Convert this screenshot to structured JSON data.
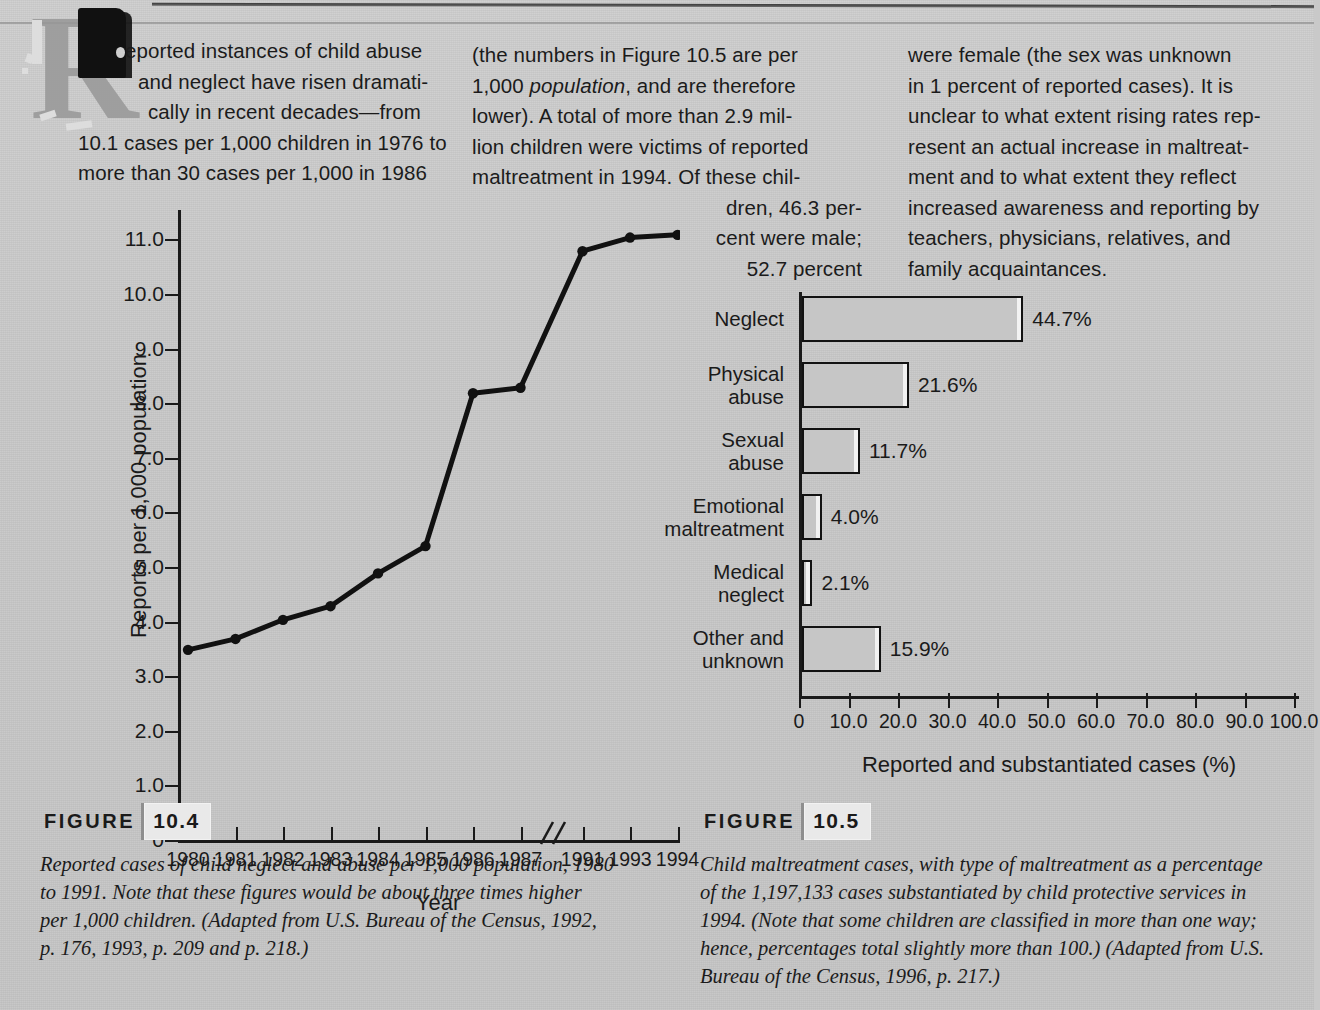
{
  "body_text": {
    "column1": {
      "lines": [
        "eported instances of child abuse",
        "and neglect have risen dramati-",
        "cally in recent decades—from",
        "10.1 cases per 1,000 children in 1976 to",
        "more than 30 cases per 1,000 in 1986"
      ],
      "dropcap": "R"
    },
    "column2": {
      "lines": [
        "(the numbers in Figure 10.5 are per",
        "1,000 population, and are therefore",
        "lower). A total of more than 2.9 mil-",
        "lion children were victims of reported",
        "maltreatment in 1994. Of these chil-"
      ],
      "italic_word": "population",
      "wrapped_lines": [
        "dren, 46.3 per-",
        "cent were male;",
        "52.7 percent"
      ]
    },
    "column3": {
      "lines": [
        "were female (the sex was unknown",
        "in 1 percent of reported cases). It is",
        "unclear to what extent rising rates rep-",
        "resent an actual increase in maltreat-",
        "ment and to what extent they reflect",
        "increased awareness and reporting by",
        "teachers, physicians, relatives, and",
        "family acquaintances."
      ]
    }
  },
  "chart_data": [
    {
      "id": "figure-10-4",
      "type": "line",
      "title": "",
      "xlabel": "Year",
      "ylabel": "Reports per 1,000 population",
      "categories": [
        "1980",
        "1981",
        "1982",
        "1983",
        "1984",
        "1985",
        "1986",
        "1987",
        "1991",
        "1993",
        "1994"
      ],
      "values": [
        3.5,
        3.7,
        4.05,
        4.3,
        4.9,
        5.4,
        8.2,
        8.3,
        10.8,
        11.05,
        11.1
      ],
      "ylim": [
        0,
        11.5
      ],
      "yticks": [
        "0",
        "1.0",
        "2.0",
        "3.0",
        "4.0",
        "5.0",
        "6.0",
        "7.0",
        "8.0",
        "9.0",
        "10.0",
        "11.0"
      ],
      "ytick_values": [
        0,
        1,
        2,
        3,
        4,
        5,
        6,
        7,
        8,
        9,
        10,
        11
      ],
      "axis_break_after": "1987",
      "grid": false,
      "legend": "none",
      "marker": "filled-circle"
    },
    {
      "id": "figure-10-5",
      "type": "bar",
      "orientation": "horizontal",
      "title": "",
      "xlabel": "Reported and substantiated cases (%)",
      "ylabel": "",
      "categories": [
        "Neglect",
        "Physical\nabuse",
        "Sexual\nabuse",
        "Emotional\nmaltreatment",
        "Medical\nneglect",
        "Other and\nunknown"
      ],
      "values": [
        44.7,
        21.6,
        11.7,
        4.0,
        2.1,
        15.9
      ],
      "value_labels": [
        "44.7%",
        "21.6%",
        "11.7%",
        "4.0%",
        "2.1%",
        "15.9%"
      ],
      "xlim": [
        0,
        100
      ],
      "xticks": [
        "0",
        "10.0",
        "20.0",
        "30.0",
        "40.0",
        "50.0",
        "60.0",
        "70.0",
        "80.0",
        "90.0",
        "100.0"
      ],
      "xtick_values": [
        0,
        10,
        20,
        30,
        40,
        50,
        60,
        70,
        80,
        90,
        100
      ],
      "grid": false,
      "legend": "none",
      "bar_fill": "#c6c6c6",
      "bar_stroke": "#121212"
    }
  ],
  "figures": {
    "fig104": {
      "tag_word": "FIGURE",
      "tag_number": "10.4",
      "caption_lines": [
        "Reported cases of child neglect and abuse per 1,000 population, 1980",
        "to 1991. Note that these figures would be about three times higher",
        "per 1,000 children. (Adapted from U.S. Bureau of the Census, 1992,",
        "p. 176, 1993, p. 209 and p. 218.)"
      ]
    },
    "fig105": {
      "tag_word": "FIGURE",
      "tag_number": "10.5",
      "caption_lines": [
        "Child maltreatment cases, with type of maltreatment as a percentage",
        "of the 1,197,133 cases substantiated by child protective services in",
        "1994. (Note that some children are classified in more than one way;",
        "hence, percentages total slightly more than 100.) (Adapted from U.S.",
        "Bureau of the Census, 1996, p. 217.)"
      ]
    }
  },
  "colors": {
    "page_background": "#c9c9c9",
    "ink": "#1a1a1a",
    "bar_fill": "#c6c6c6",
    "badge_background": "#e9e9e9"
  }
}
